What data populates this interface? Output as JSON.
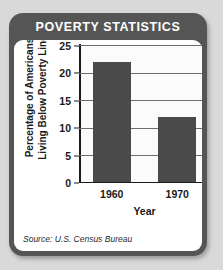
{
  "card": {
    "title": "POVERTY STATISTICS",
    "source": "Source: U.S. Census Bureau",
    "header_color": "#555555",
    "panel_color": "#ffffff"
  },
  "chart_data": {
    "type": "bar",
    "title": "POVERTY STATISTICS",
    "categories": [
      "1960",
      "1970"
    ],
    "values": [
      22,
      12
    ],
    "xlabel": "Year",
    "ylabel": "Percentage of Americans Living Below Poverty Line",
    "ylabel_lines": [
      "Percentage of Americans",
      "Living Below Poverty Line"
    ],
    "ylim": [
      0,
      25
    ],
    "yticks": [
      0,
      5,
      10,
      15,
      20,
      25
    ],
    "ytick_labels": [
      "0",
      "5",
      "10",
      "15",
      "20",
      "25"
    ],
    "grid": true,
    "legend": false,
    "bar_color": "#4a4a4a",
    "plot_background": "#fbfbfb",
    "source": "Source: U.S. Census Bureau"
  }
}
